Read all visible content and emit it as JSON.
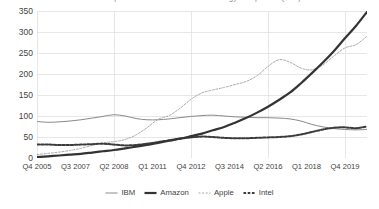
{
  "title": {
    "text": "Market capitalisation of selected technology companies ($bn)",
    "clipped": true
  },
  "legend": {
    "position": "bottom-center",
    "items": [
      {
        "label": "IBM",
        "style": "thin-solid",
        "color": "#8a8a8a",
        "icon": "line-swatch-icon"
      },
      {
        "label": "Amazon",
        "style": "thick-solid",
        "color": "#333333",
        "icon": "line-swatch-icon"
      },
      {
        "label": "Apple",
        "style": "fine-dashed",
        "color": "#a8a8a8",
        "icon": "dashed-swatch-icon"
      },
      {
        "label": "Intel",
        "style": "bold-dashed",
        "color": "#3b3b3b",
        "icon": "dashed-swatch-icon"
      }
    ]
  },
  "axes": {
    "y_ticks": [
      "0",
      "50",
      "100",
      "150",
      "200",
      "250",
      "300",
      "350"
    ],
    "x_ticks": [
      "Q4 2005",
      "Q3 2007",
      "Q2 2008",
      "Q1 2011",
      "Q4 2012",
      "Q3 2014",
      "Q2 2016",
      "Q1 2018",
      "Q4 2019"
    ]
  },
  "chart_data": {
    "type": "line",
    "title": "Market capitalisation of selected technology companies ($bn)",
    "xlabel": "",
    "ylabel": "",
    "ylim": [
      0,
      350
    ],
    "grid": true,
    "legend_position": "bottom",
    "x_tick_labels": [
      "Q4 2005",
      "Q3 2007",
      "Q2 2008",
      "Q1 2011",
      "Q4 2012",
      "Q3 2014",
      "Q2 2016",
      "Q1 2018",
      "Q4 2019"
    ],
    "x_tick_positions": [
      0.0,
      0.1167,
      0.2333,
      0.35,
      0.4667,
      0.5833,
      0.7,
      0.8167,
      0.9333
    ],
    "x": [
      0.0,
      0.033,
      0.067,
      0.1,
      0.133,
      0.167,
      0.2,
      0.233,
      0.267,
      0.3,
      0.333,
      0.367,
      0.4,
      0.433,
      0.467,
      0.5,
      0.533,
      0.567,
      0.6,
      0.633,
      0.667,
      0.7,
      0.733,
      0.767,
      0.8,
      0.833,
      0.867,
      0.9,
      0.933,
      0.967,
      1.0
    ],
    "series": [
      {
        "name": "IBM",
        "style": "thin-solid",
        "color": "#8a8a8a",
        "values": [
          87,
          85,
          86,
          88,
          91,
          95,
          99,
          103,
          100,
          94,
          91,
          91,
          93,
          96,
          99,
          101,
          102,
          100,
          98,
          97,
          96,
          96,
          95,
          93,
          88,
          80,
          74,
          70,
          68,
          67,
          68
        ]
      },
      {
        "name": "Amazon",
        "style": "thick-solid",
        "color": "#333333",
        "values": [
          2,
          4,
          6,
          8,
          10,
          13,
          16,
          19,
          23,
          27,
          31,
          36,
          41,
          46,
          52,
          58,
          66,
          74,
          84,
          95,
          108,
          122,
          138,
          156,
          178,
          202,
          228,
          255,
          285,
          315,
          348
        ]
      },
      {
        "name": "Apple",
        "style": "fine-dashed",
        "color": "#a8a8a8",
        "values": [
          8,
          11,
          14,
          18,
          23,
          30,
          36,
          39,
          44,
          55,
          72,
          92,
          101,
          118,
          140,
          155,
          162,
          168,
          175,
          182,
          196,
          218,
          234,
          228,
          214,
          210,
          222,
          243,
          262,
          270,
          290
        ]
      },
      {
        "name": "Intel",
        "style": "bold-dashed",
        "color": "#3b3b3b",
        "values": [
          32,
          32,
          31,
          31,
          32,
          33,
          34,
          32,
          30,
          31,
          34,
          38,
          42,
          46,
          49,
          51,
          50,
          48,
          47,
          47,
          48,
          49,
          50,
          52,
          56,
          62,
          68,
          72,
          73,
          71,
          75
        ]
      }
    ]
  }
}
